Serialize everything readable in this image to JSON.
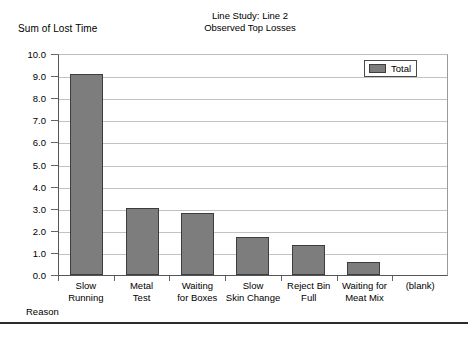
{
  "chart_data": {
    "type": "bar",
    "title": "Line Study: Line 2\nObserved Top Losses",
    "title_line1": "Line Study: Line 2",
    "title_line2": "Observed Top Losses",
    "xlabel": "Reason",
    "ylabel": "Sum of Lost Time",
    "categories": [
      "Slow\nRunning",
      "Metal\nTest",
      "Waiting\nfor Boxes",
      "Slow\nSkin Change",
      "Reject Bin\nFull",
      "Waiting for\nMeat Mix",
      "(blank)"
    ],
    "series": [
      {
        "name": "Total",
        "values": [
          9.05,
          3.0,
          2.8,
          1.7,
          1.35,
          0.6,
          0
        ]
      }
    ],
    "ylim": [
      0.0,
      10.0
    ],
    "ytick_step": 1.0,
    "ytick_labels": [
      "10.0",
      "9.0",
      "8.0",
      "7.0",
      "6.0",
      "5.0",
      "4.0",
      "3.0",
      "2.0",
      "1.0",
      "0.0"
    ],
    "grid": true,
    "legend_position": "upper right",
    "legend_entries": [
      "Total"
    ],
    "bar_color": "#7d7d7d",
    "bar_border_color": "#3d3d3d",
    "gridline_color": "#c2c2c2",
    "axis_color": "#555555"
  }
}
